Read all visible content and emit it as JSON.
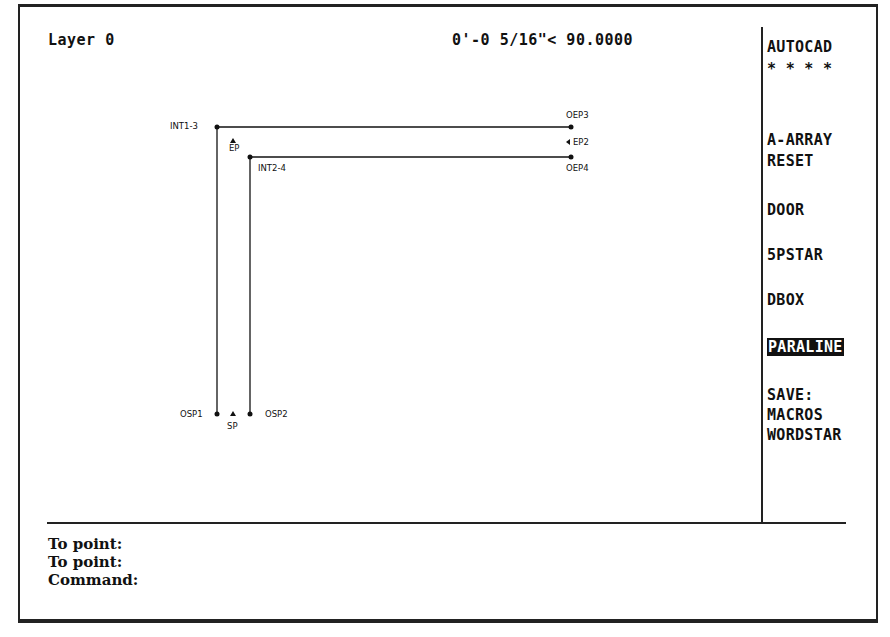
{
  "status_bar": {
    "layer": "Layer 0",
    "coordinates": "0'-0 5/16\"< 90.0000"
  },
  "side_menu": {
    "items": [
      {
        "label": "AUTOCAD",
        "selected": false
      },
      {
        "label": "* * * *",
        "selected": false
      },
      {
        "label": "A-ARRAY",
        "selected": false
      },
      {
        "label": "RESET",
        "selected": false
      },
      {
        "label": "DOOR",
        "selected": false
      },
      {
        "label": "5PSTAR",
        "selected": false
      },
      {
        "label": "DBOX",
        "selected": false
      },
      {
        "label": "PARALINE",
        "selected": true
      },
      {
        "label": "SAVE:",
        "selected": false
      },
      {
        "label": "MACROS",
        "selected": false
      },
      {
        "label": "WORDSTAR",
        "selected": false
      }
    ]
  },
  "command_area": {
    "lines": [
      "To point:",
      "To point:",
      "Command:"
    ]
  },
  "drawing": {
    "labels": {
      "int1": "INT1-3",
      "int2": "INT2-4",
      "ep": "EP",
      "oep3": "OEP3",
      "ep2": "EP2",
      "oep4": "OEP4",
      "osp1": "OSP1",
      "sp": "SP",
      "osp2": "OSP2"
    }
  }
}
